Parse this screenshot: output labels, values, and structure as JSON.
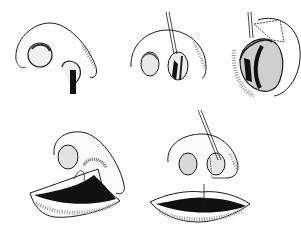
{
  "figure": {
    "colors": {
      "ink": "#1a1a1a",
      "shade": "#888888",
      "background": "#ffffff"
    },
    "panels": [
      {
        "id": "step-1",
        "label": ""
      },
      {
        "id": "step-2",
        "label": ""
      },
      {
        "id": "step-3",
        "label": ""
      },
      {
        "id": "step-4",
        "label": ""
      },
      {
        "id": "step-5",
        "label": ""
      }
    ]
  }
}
